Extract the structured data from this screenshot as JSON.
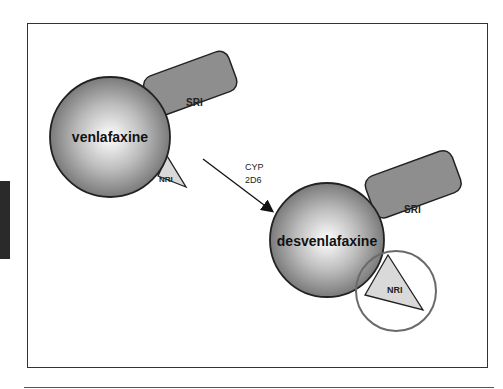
{
  "diagram": {
    "parent_drug": {
      "name": "venlafaxine",
      "arms": [
        {
          "label": "SRI",
          "fill": "#8e8e8e"
        },
        {
          "label": "NRI",
          "fill": "#d9d9d9"
        }
      ]
    },
    "metabolism": {
      "enzyme_line1": "CYP",
      "enzyme_line2": "2D6"
    },
    "metabolite": {
      "name": "desvenlafaxine",
      "arms": [
        {
          "label": "SRI",
          "fill": "#8e8e8e"
        },
        {
          "label": "NRI",
          "fill": "#d9d9d9",
          "highlighted": true
        }
      ]
    },
    "colors": {
      "sphere_edge": "#7a7a7a",
      "sphere_center": "#ffffff",
      "outline": "#222222",
      "highlight_ring": "#6a6a6a"
    }
  }
}
